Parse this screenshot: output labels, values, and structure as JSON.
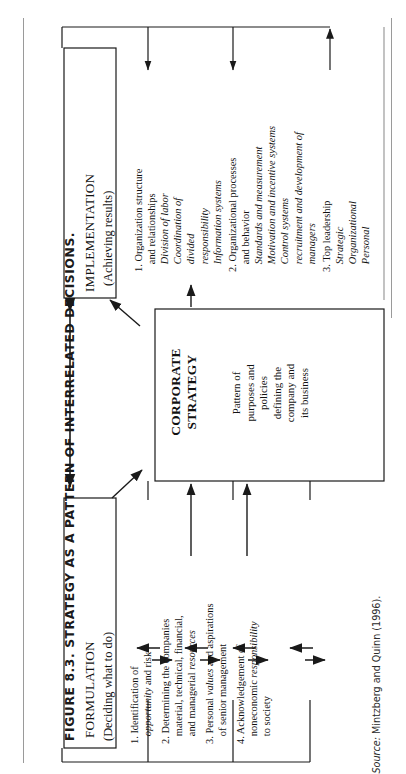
{
  "figure": {
    "title": "FIGURE 8.3. STRATEGY AS A PATTERN OF INTERRELATED DECISIONS.",
    "source_label": "Source:",
    "source_text": " Mintzberg and Quinn (1996)."
  },
  "boxes": {
    "implementation": {
      "title": "IMPLEMENTATION",
      "subtitle": "(Achieving results)"
    },
    "formulation": {
      "title": "FORMULATION",
      "subtitle": "(Deciding what to do)"
    },
    "corporate_strategy": {
      "title_line1": "CORPORATE",
      "title_line2": "STRATEGY",
      "body_line1": "Pattern of",
      "body_line2": "purposes and",
      "body_line3": "policies",
      "body_line4": "defining the",
      "body_line5": "company and",
      "body_line6": "its business"
    }
  },
  "implementation_items": [
    {
      "number": "1.",
      "lines": [
        {
          "text": "Organization structure",
          "italic": false
        },
        {
          "text": "and relationships",
          "italic": false
        },
        {
          "text": "Division of labor",
          "italic": true
        },
        {
          "text": "Coordination of",
          "italic": true
        },
        {
          "text": "divided",
          "italic": true
        },
        {
          "text": "responsibility",
          "italic": true
        },
        {
          "text": "Information systems",
          "italic": true
        }
      ]
    },
    {
      "number": "2.",
      "lines": [
        {
          "text": "Organizational processes",
          "italic": false
        },
        {
          "text": "and behavior",
          "italic": false
        },
        {
          "text": "Standards and measurement",
          "italic": true
        },
        {
          "text": "Motivation and incentive systems",
          "italic": true
        },
        {
          "text": "Control systems",
          "italic": true
        },
        {
          "text": "recruitment and development of",
          "italic": true
        },
        {
          "text": "managers",
          "italic": true
        }
      ]
    },
    {
      "number": "3.",
      "lines": [
        {
          "text": "Top leadership",
          "italic": false
        },
        {
          "text": "Strategic",
          "italic": true
        },
        {
          "text": "Organizational",
          "italic": true
        },
        {
          "text": "Personal",
          "italic": true
        }
      ]
    }
  ],
  "formulation_items": [
    {
      "number": "1.",
      "lines": [
        {
          "text": "Identification of",
          "italic": false
        },
        {
          "text": "opportunity",
          "italic": true,
          "suffix": " and risk"
        }
      ]
    },
    {
      "number": "2.",
      "lines": [
        {
          "text": "Determining the companies",
          "italic": false
        },
        {
          "text": "material, technical, financial,",
          "italic": false
        },
        {
          "text": "and managerial ",
          "italic": false,
          "italic_tail": "resources"
        }
      ]
    },
    {
      "number": "3.",
      "lines": [
        {
          "text": "Personal ",
          "italic": false,
          "italic_mid": "values",
          "tail": " and aspirations"
        },
        {
          "text": "of senior management",
          "italic": false
        }
      ]
    },
    {
      "number": "4.",
      "lines": [
        {
          "text": "Acknowledgement of",
          "italic": false
        },
        {
          "text": "noneconomic ",
          "italic": false,
          "italic_tail2": "responsibility"
        },
        {
          "text": "to society",
          "italic": false
        }
      ]
    }
  ],
  "colors": {
    "stroke": "#1a1a1a",
    "light_rule": "#9a9a9a",
    "background": "#ffffff",
    "text": "#111111"
  }
}
